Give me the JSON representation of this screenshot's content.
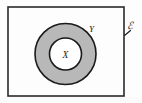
{
  "figure": {
    "universal_set_label": "ℰ",
    "outer_set_label": "Y",
    "inner_set_label": "X",
    "colors": {
      "background": "#fdfdfd",
      "stroke": "#1a1a1a",
      "annulus_fill": "#b8b8b8",
      "inner_fill": "#ffffff",
      "rect_stroke": "#2a2a2a"
    },
    "universal_rect": {
      "x": 8,
      "y": 7,
      "width": 116,
      "height": 89,
      "stroke_width": 1.6
    },
    "outer_circle": {
      "cx": 65.5,
      "cy": 54,
      "r": 30.5,
      "stroke_width": 1.6
    },
    "inner_circle": {
      "cx": 65.5,
      "cy": 54,
      "r": 16,
      "stroke_width": 1.6
    },
    "label_positions": {
      "inner": {
        "x": 65.5,
        "y": 57.5
      },
      "outer": {
        "x": 91.5,
        "y": 31.5
      },
      "universal": {
        "x": 129.5,
        "y": 28.5
      }
    },
    "leader_line": {
      "x1": 124.5,
      "y1": 35.5,
      "x2": 130.5,
      "y2": 30.5,
      "stroke_width": 1.1
    }
  }
}
